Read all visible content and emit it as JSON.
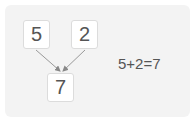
{
  "diagram": {
    "top_left_value": "5",
    "top_right_value": "2",
    "result_value": "7",
    "equation": "5+2=7"
  },
  "colors": {
    "card_bg": "#f3f3f3",
    "box_bg": "#ffffff",
    "box_border": "#dcdcdc",
    "text": "#555555",
    "arrow": "#888888"
  }
}
